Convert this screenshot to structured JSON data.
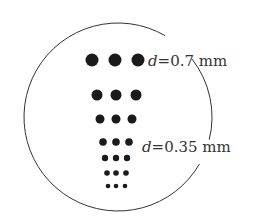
{
  "diagram": {
    "title": "",
    "circle": {
      "cx": 118,
      "cy": 117,
      "r": 94,
      "stroke": "#333333"
    },
    "dot_color": "#1a1a1a",
    "rows": [
      {
        "y": 60,
        "r": 6.5,
        "xs": [
          92,
          115,
          138
        ]
      },
      {
        "y": 95,
        "r": 5.5,
        "xs": [
          97,
          116,
          136
        ]
      },
      {
        "y": 119,
        "r": 4.5,
        "xs": [
          100,
          116,
          132
        ]
      },
      {
        "y": 142,
        "r": 3.8,
        "xs": [
          103,
          116,
          129
        ]
      },
      {
        "y": 158,
        "r": 3.2,
        "xs": [
          105,
          116,
          127
        ]
      },
      {
        "y": 173,
        "r": 2.8,
        "xs": [
          107,
          116,
          126
        ]
      },
      {
        "y": 186,
        "r": 2.3,
        "xs": [
          108,
          116,
          125
        ]
      }
    ],
    "labels": [
      {
        "var": "d",
        "text": "=0.7 mm",
        "x": 148,
        "y": 66
      },
      {
        "var": "d",
        "text": "=0.35 mm",
        "x": 142,
        "y": 152
      }
    ]
  }
}
